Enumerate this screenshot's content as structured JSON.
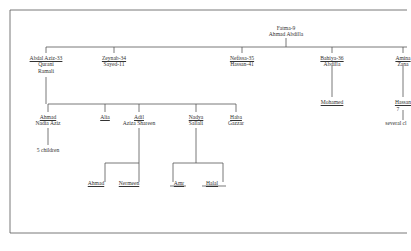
{
  "diagram": {
    "type": "family-tree",
    "root": {
      "line1": "Fatma-9",
      "line2": "Ahmad Abdilla"
    },
    "children": [
      {
        "line1": "Abdal Aziz-33",
        "line2": "Qurani",
        "line3": "Ramali"
      },
      {
        "line1": "Zeynab-34",
        "line2": "Sayed-11"
      },
      {
        "line1": "Nefissa-35",
        "line2": "Hassan-41"
      },
      {
        "line1": "Bahiya-36",
        "line2": "Abdilla"
      },
      {
        "line1": "Amina",
        "line2": "Zana"
      }
    ],
    "abdal_aziz_children": [
      {
        "line1": "Ahmad",
        "line2": "Nadia Aziz",
        "note": "5 children"
      },
      {
        "line1": "Alia"
      },
      {
        "line1": "Adil",
        "line2": "Aziza Shareen"
      },
      {
        "line1": "Nadya",
        "line2": "Sallali"
      },
      {
        "line1": "Haba",
        "line2": "Gazzar"
      }
    ],
    "adil_children": [
      {
        "line1": "Ahmad"
      },
      {
        "line1": "Nermeen"
      }
    ],
    "nadya_children": [
      {
        "line1": "Amr"
      },
      {
        "line1": "Halal"
      }
    ],
    "bahiya_children": [
      {
        "line1": "Mohamed"
      }
    ],
    "amina_children": [
      {
        "line1": "Hassan",
        "line2": "7",
        "note": "several cl"
      }
    ]
  }
}
